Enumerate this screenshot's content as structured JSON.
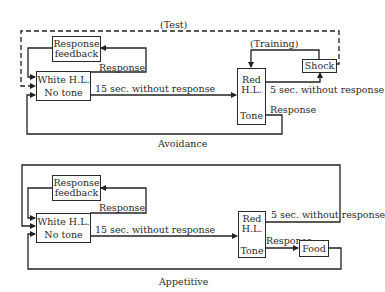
{
  "diagrams": [
    {
      "caption": "Avoidance",
      "test_label": "(Test)",
      "training_label": "(Training)",
      "feedback_box": [
        "Response",
        "feedback"
      ],
      "white_box": [
        "White H.L.",
        "No tone"
      ],
      "red_box": [
        "Red",
        "H.L.",
        "Tone"
      ],
      "outcome_box": "Shock",
      "edges": {
        "response_to_feedback": "Response",
        "white_to_red": "15 sec. without response",
        "red_to_outcome": "5 sec. without response",
        "red_response": "Response"
      }
    },
    {
      "caption": "Appetitive",
      "feedback_box": [
        "Response",
        "feedback"
      ],
      "white_box": [
        "White H.L.",
        "No tone"
      ],
      "red_box": [
        "Red",
        "H.L.",
        "Tone"
      ],
      "outcome_box": "Food",
      "edges": {
        "response_to_feedback": "Response",
        "white_to_red": "15 sec. without response",
        "red_to_loop": "5 sec. without response",
        "red_response": "Response"
      }
    }
  ]
}
